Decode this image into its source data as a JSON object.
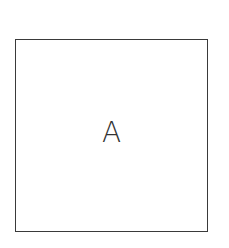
{
  "diagram": {
    "shapes": [
      {
        "type": "square",
        "label": "A",
        "border_color": "#3a3a3a",
        "fill_color": "#ffffff"
      }
    ]
  }
}
